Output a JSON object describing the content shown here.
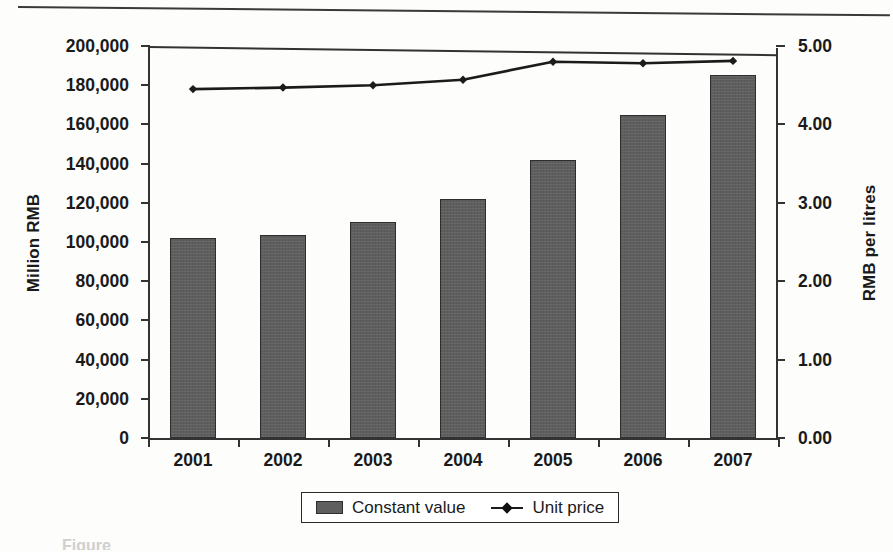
{
  "chart_data": {
    "type": "bar",
    "title": "",
    "categories": [
      "2001",
      "2002",
      "2003",
      "2004",
      "2005",
      "2006",
      "2007"
    ],
    "xlabel": "",
    "ylabel": "Million RMB",
    "y2label": "RMB per litres",
    "ylim": [
      0,
      200000
    ],
    "y2lim": [
      0,
      5.0
    ],
    "y_ticks": [
      "0",
      "20,000",
      "40,000",
      "60,000",
      "80,000",
      "100,000",
      "120,000",
      "140,000",
      "160,000",
      "180,000",
      "200,000"
    ],
    "y_tick_values": [
      0,
      20000,
      40000,
      60000,
      80000,
      100000,
      120000,
      140000,
      160000,
      180000,
      200000
    ],
    "y2_ticks": [
      "0.00",
      "1.00",
      "2.00",
      "3.00",
      "4.00",
      "5.00"
    ],
    "y2_tick_values": [
      0,
      1,
      2,
      3,
      4,
      5
    ],
    "grid": false,
    "legend_position": "bottom",
    "series": [
      {
        "name": "Constant value",
        "type": "bar",
        "axis": "left",
        "unit": "Million RMB",
        "color": "#5e5e5e",
        "values": [
          102000,
          103500,
          110000,
          122000,
          142000,
          165000,
          185000
        ]
      },
      {
        "name": "Unit price",
        "type": "line",
        "axis": "right",
        "unit": "RMB per litres",
        "color": "#1b1b1b",
        "marker": "diamond",
        "values": [
          4.45,
          4.47,
          4.5,
          4.57,
          4.8,
          4.78,
          4.81
        ]
      }
    ]
  },
  "legend": {
    "items": [
      {
        "label": "Constant value",
        "marker": "bar-swatch"
      },
      {
        "label": "Unit price",
        "marker": "line-diamond"
      }
    ]
  },
  "caption": {
    "text": "Figure"
  }
}
